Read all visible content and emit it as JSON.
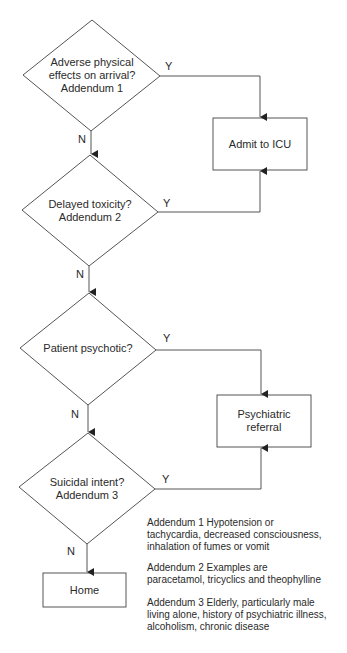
{
  "diagram": {
    "type": "flowchart",
    "decisions": [
      {
        "id": "d1",
        "label_lines": [
          "Adverse physical",
          "effects on arrival?",
          "Addendum 1"
        ]
      },
      {
        "id": "d2",
        "label_lines": [
          "Delayed toxicity?",
          "Addendum 2"
        ]
      },
      {
        "id": "d3",
        "label_lines": [
          "Patient psychotic?"
        ]
      },
      {
        "id": "d4",
        "label_lines": [
          "Suicidal intent?",
          "Addendum 3"
        ]
      }
    ],
    "outcomes": [
      {
        "id": "icu",
        "label_lines": [
          "Admit to ICU"
        ]
      },
      {
        "id": "psych",
        "label_lines": [
          "Psychiatric",
          "referral"
        ]
      },
      {
        "id": "home",
        "label_lines": [
          "Home"
        ]
      }
    ],
    "edges": [
      {
        "from": "d1",
        "to": "icu",
        "label": "Y"
      },
      {
        "from": "d1",
        "to": "d2",
        "label": "N"
      },
      {
        "from": "d2",
        "to": "icu",
        "label": "Y"
      },
      {
        "from": "d2",
        "to": "d3",
        "label": "N"
      },
      {
        "from": "d3",
        "to": "psych",
        "label": "Y"
      },
      {
        "from": "d3",
        "to": "d4",
        "label": "N"
      },
      {
        "from": "d4",
        "to": "psych",
        "label": "Y"
      },
      {
        "from": "d4",
        "to": "home",
        "label": "N"
      }
    ],
    "addenda": [
      {
        "lines": [
          "Addendum 1  Hypotension or",
          "tachycardia, decreased consciousness,",
          "inhalation of fumes or vomit"
        ]
      },
      {
        "lines": [
          "Addendum 2  Examples are",
          "paracetamol, tricyclics and theophylline"
        ]
      },
      {
        "lines": [
          "Addendum 3  Elderly, particularly male",
          "living alone, history of psychiatric illness,",
          "alcoholism, chronic disease"
        ]
      }
    ],
    "colors": {
      "stroke": "#555555",
      "text": "#2a2a2a",
      "background": "#ffffff"
    }
  }
}
